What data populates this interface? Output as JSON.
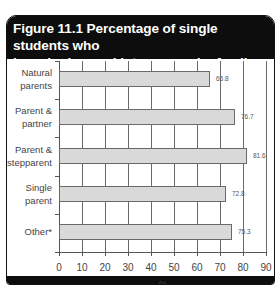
{
  "chart_data": {
    "type": "bar",
    "orientation": "horizontal",
    "title": "Figure 11.1 Percentage of single students who have had sexual intercourse by family structure",
    "title_lines": [
      "Figure 11.1 Percentage of single students who",
      "have had sexual intercourse by family structure"
    ],
    "categories": [
      "Natural parents",
      "Parent & partner",
      "Parent & stepparent",
      "Single parent",
      "Other*"
    ],
    "category_lines": [
      [
        "Natural",
        "parents"
      ],
      [
        "Parent &",
        "partner"
      ],
      [
        "Parent &",
        "stepparent"
      ],
      [
        "Single",
        "parent"
      ],
      [
        "Other*"
      ]
    ],
    "values": [
      65.8,
      76.7,
      81.6,
      72.8,
      75.3
    ],
    "value_labels": [
      "65.8",
      "76.7",
      "81.6",
      "72.8",
      "75.3"
    ],
    "xlabel": "%",
    "ylabel": "",
    "xlim": [
      0,
      90
    ],
    "xticks": [
      "0",
      "10",
      "20",
      "30",
      "40",
      "50",
      "60",
      "70",
      "80",
      "90"
    ],
    "grid": "vertical",
    "legend": "none",
    "bar_color": "#d9d9d9",
    "header_color": "#0d0d0d"
  }
}
